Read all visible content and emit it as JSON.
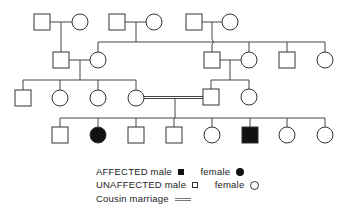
{
  "diagram": {
    "type": "pedigree",
    "colors": {
      "line": "#444444",
      "affected": "#111111",
      "background": "#ffffff"
    },
    "symbol_size": 16,
    "individuals": [
      {
        "id": "I-1",
        "sex": "male",
        "affected": false,
        "cx": 42,
        "cy": 22
      },
      {
        "id": "I-2",
        "sex": "female",
        "affected": false,
        "cx": 80,
        "cy": 22
      },
      {
        "id": "I-3",
        "sex": "male",
        "affected": false,
        "cx": 117,
        "cy": 22
      },
      {
        "id": "I-4",
        "sex": "female",
        "affected": false,
        "cx": 154,
        "cy": 22
      },
      {
        "id": "I-5",
        "sex": "male",
        "affected": false,
        "cx": 194,
        "cy": 22
      },
      {
        "id": "I-6",
        "sex": "female",
        "affected": false,
        "cx": 230,
        "cy": 22
      },
      {
        "id": "II-1",
        "sex": "male",
        "affected": false,
        "cx": 61,
        "cy": 60
      },
      {
        "id": "II-2",
        "sex": "female",
        "affected": false,
        "cx": 98,
        "cy": 60
      },
      {
        "id": "II-3",
        "sex": "male",
        "affected": false,
        "cx": 212,
        "cy": 60
      },
      {
        "id": "II-4",
        "sex": "female",
        "affected": false,
        "cx": 249,
        "cy": 60
      },
      {
        "id": "II-5",
        "sex": "male",
        "affected": false,
        "cx": 287,
        "cy": 60
      },
      {
        "id": "II-6",
        "sex": "female",
        "affected": false,
        "cx": 325,
        "cy": 60
      },
      {
        "id": "III-1",
        "sex": "male",
        "affected": false,
        "cx": 23,
        "cy": 98
      },
      {
        "id": "III-2",
        "sex": "female",
        "affected": false,
        "cx": 60,
        "cy": 98
      },
      {
        "id": "III-3",
        "sex": "female",
        "affected": false,
        "cx": 98,
        "cy": 98
      },
      {
        "id": "III-4",
        "sex": "female",
        "affected": false,
        "cx": 136,
        "cy": 98
      },
      {
        "id": "III-5",
        "sex": "male",
        "affected": false,
        "cx": 211,
        "cy": 97
      },
      {
        "id": "III-6",
        "sex": "female",
        "affected": false,
        "cx": 249,
        "cy": 97
      },
      {
        "id": "IV-1",
        "sex": "male",
        "affected": false,
        "cx": 60,
        "cy": 135
      },
      {
        "id": "IV-2",
        "sex": "female",
        "affected": true,
        "cx": 98,
        "cy": 135
      },
      {
        "id": "IV-3",
        "sex": "male",
        "affected": false,
        "cx": 136,
        "cy": 135
      },
      {
        "id": "IV-4",
        "sex": "male",
        "affected": false,
        "cx": 174,
        "cy": 135
      },
      {
        "id": "IV-5",
        "sex": "female",
        "affected": false,
        "cx": 212,
        "cy": 135
      },
      {
        "id": "IV-6",
        "sex": "male",
        "affected": true,
        "cx": 250,
        "cy": 135
      },
      {
        "id": "IV-7",
        "sex": "female",
        "affected": false,
        "cx": 287,
        "cy": 135
      },
      {
        "id": "IV-8",
        "sex": "female",
        "affected": false,
        "cx": 325,
        "cy": 135
      }
    ],
    "lines": [
      {
        "name": "marriage-I-1-2",
        "x1": 50,
        "y1": 22,
        "x2": 72,
        "y2": 22
      },
      {
        "name": "descent-I-1-2",
        "x1": 61,
        "y1": 22,
        "x2": 61,
        "y2": 52
      },
      {
        "name": "marriage-I-3-4",
        "x1": 125,
        "y1": 22,
        "x2": 146,
        "y2": 22
      },
      {
        "name": "descent-I-3-4",
        "x1": 136,
        "y1": 22,
        "x2": 136,
        "y2": 42
      },
      {
        "name": "marriage-I-5-6",
        "x1": 202,
        "y1": 22,
        "x2": 222,
        "y2": 22
      },
      {
        "name": "descent-I-5-6-a",
        "x1": 212,
        "y1": 22,
        "x2": 212,
        "y2": 39
      },
      {
        "name": "descent-I-5-6-b",
        "x1": 212,
        "y1": 45,
        "x2": 212,
        "y2": 52
      },
      {
        "name": "sibship-I-3-4",
        "x1": 98,
        "y1": 42,
        "x2": 325,
        "y2": 42
      },
      {
        "name": "drop-II-2",
        "x1": 98,
        "y1": 42,
        "x2": 98,
        "y2": 52
      },
      {
        "name": "drop-II-4",
        "x1": 249,
        "y1": 42,
        "x2": 249,
        "y2": 52
      },
      {
        "name": "drop-II-5",
        "x1": 287,
        "y1": 42,
        "x2": 287,
        "y2": 52
      },
      {
        "name": "drop-II-6",
        "x1": 325,
        "y1": 42,
        "x2": 325,
        "y2": 52
      },
      {
        "name": "marriage-II-1-2",
        "x1": 69,
        "y1": 60,
        "x2": 90,
        "y2": 60
      },
      {
        "name": "descent-II-1-2",
        "x1": 80,
        "y1": 60,
        "x2": 80,
        "y2": 80
      },
      {
        "name": "marriage-II-3-4",
        "x1": 220,
        "y1": 60,
        "x2": 241,
        "y2": 60
      },
      {
        "name": "descent-II-3-4",
        "x1": 230,
        "y1": 60,
        "x2": 230,
        "y2": 80
      },
      {
        "name": "sibship-II-1-2",
        "x1": 23,
        "y1": 80,
        "x2": 136,
        "y2": 80
      },
      {
        "name": "drop-III-1",
        "x1": 23,
        "y1": 80,
        "x2": 23,
        "y2": 90
      },
      {
        "name": "drop-III-2",
        "x1": 60,
        "y1": 80,
        "x2": 60,
        "y2": 90
      },
      {
        "name": "drop-III-3",
        "x1": 98,
        "y1": 80,
        "x2": 98,
        "y2": 90
      },
      {
        "name": "drop-III-4",
        "x1": 136,
        "y1": 80,
        "x2": 136,
        "y2": 90
      },
      {
        "name": "sibship-II-3-4",
        "x1": 211,
        "y1": 80,
        "x2": 249,
        "y2": 80
      },
      {
        "name": "drop-III-5",
        "x1": 211,
        "y1": 80,
        "x2": 211,
        "y2": 89
      },
      {
        "name": "drop-III-6",
        "x1": 249,
        "y1": 80,
        "x2": 249,
        "y2": 89
      },
      {
        "name": "descent-III-4-5",
        "x1": 175,
        "y1": 98,
        "x2": 175,
        "y2": 118
      },
      {
        "name": "sibship-III-4-5",
        "x1": 60,
        "y1": 118,
        "x2": 325,
        "y2": 118
      },
      {
        "name": "drop-IV-1",
        "x1": 60,
        "y1": 118,
        "x2": 60,
        "y2": 127
      },
      {
        "name": "drop-IV-2",
        "x1": 98,
        "y1": 118,
        "x2": 98,
        "y2": 127
      },
      {
        "name": "drop-IV-3",
        "x1": 136,
        "y1": 118,
        "x2": 136,
        "y2": 127
      },
      {
        "name": "drop-IV-4",
        "x1": 174,
        "y1": 118,
        "x2": 174,
        "y2": 127
      },
      {
        "name": "drop-IV-5",
        "x1": 212,
        "y1": 118,
        "x2": 212,
        "y2": 127
      },
      {
        "name": "drop-IV-6",
        "x1": 250,
        "y1": 118,
        "x2": 250,
        "y2": 127
      },
      {
        "name": "drop-IV-7",
        "x1": 287,
        "y1": 118,
        "x2": 287,
        "y2": 127
      },
      {
        "name": "drop-IV-8",
        "x1": 325,
        "y1": 118,
        "x2": 325,
        "y2": 127
      }
    ],
    "bridges": [
      {
        "name": "crossing-hop",
        "x": 212,
        "y": 42
      }
    ],
    "consanguineous_marriages": [
      {
        "name": "cousin-marriage-III-4-5",
        "x1": 144,
        "x2": 203,
        "y": 97.5
      }
    ]
  },
  "legend": {
    "affected_label": "AFFECTED",
    "unaffected_label": "UNAFFECTED",
    "male_label": "male",
    "female_label": "female",
    "cousin_marriage_label": "Cousin marriage"
  }
}
